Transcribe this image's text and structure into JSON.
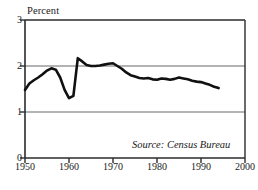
{
  "chart_data": {
    "type": "line",
    "title": "",
    "subtitle": "",
    "ylabel": "Percent",
    "xlabel": "",
    "xlim": [
      1950,
      2000
    ],
    "ylim": [
      0,
      3
    ],
    "xticks": [
      "1950",
      "1960",
      "1970",
      "1980",
      "1990",
      "2000"
    ],
    "yticks": [
      "0",
      "1",
      "2",
      "3"
    ],
    "grid": "horizontal gridlines at y = 1 and y = 2",
    "legend": "none",
    "annotations": [
      "Source: Census Bureau"
    ],
    "series": [
      {
        "name": "Percent",
        "x": [
          1950,
          1951,
          1952,
          1953,
          1954,
          1955,
          1956,
          1957,
          1958,
          1959,
          1960,
          1961,
          1962,
          1963,
          1964,
          1965,
          1966,
          1967,
          1968,
          1969,
          1970,
          1971,
          1972,
          1973,
          1974,
          1975,
          1976,
          1977,
          1978,
          1979,
          1980,
          1981,
          1982,
          1983,
          1984,
          1985,
          1986,
          1987,
          1988,
          1989,
          1990,
          1991,
          1992,
          1993,
          1994
        ],
        "values": [
          1.48,
          1.62,
          1.69,
          1.75,
          1.82,
          1.9,
          1.95,
          1.92,
          1.75,
          1.48,
          1.3,
          1.35,
          2.17,
          2.1,
          2.02,
          2.0,
          2.0,
          2.01,
          2.03,
          2.05,
          2.06,
          2.0,
          1.94,
          1.86,
          1.8,
          1.77,
          1.74,
          1.73,
          1.74,
          1.71,
          1.7,
          1.73,
          1.72,
          1.7,
          1.72,
          1.75,
          1.73,
          1.71,
          1.68,
          1.66,
          1.65,
          1.62,
          1.59,
          1.55,
          1.52
        ]
      }
    ]
  },
  "chart": {
    "y_axis_title": "Percent",
    "source_note": "Source: Census Bureau",
    "y_ticks": [
      "3",
      "2",
      "1",
      "0"
    ],
    "x_ticks": [
      "1950",
      "1960",
      "1970",
      "1980",
      "1990",
      "2000"
    ],
    "colors": {
      "line": "#111111",
      "axis": "#2b2b2b",
      "grid": "#9a9a9a",
      "background": "#ffffff"
    }
  }
}
